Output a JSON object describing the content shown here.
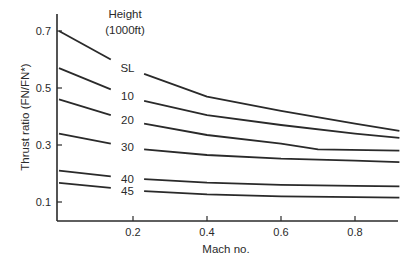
{
  "chart_data": {
    "type": "line",
    "title": "",
    "xlabel": "Mach no.",
    "ylabel": "Thrust ratio (FN/FN*)",
    "xlim": [
      0,
      0.92
    ],
    "ylim": [
      0.03,
      0.75
    ],
    "xticks": [
      0.2,
      0.4,
      0.6,
      0.8
    ],
    "xtick_labels": [
      "0.2",
      "0.4",
      "0.6",
      "0.8"
    ],
    "yticks": [
      0.1,
      0.3,
      0.5,
      0.7
    ],
    "ytick_labels": [
      "0.1",
      "0.3",
      "0.5",
      "0.7"
    ],
    "grid": false,
    "legend_title": [
      "Height",
      "(1000ft)"
    ],
    "legend_position": "inline labels between M=0.14 and M=0.23",
    "label_gap": [
      0.14,
      0.23
    ],
    "series": [
      {
        "name": "SL",
        "x": [
          0,
          0.14,
          0.23,
          0.4,
          0.6,
          0.8,
          0.92
        ],
        "values": [
          0.7,
          0.6,
          0.55,
          0.47,
          0.42,
          0.375,
          0.35
        ]
      },
      {
        "name": "10",
        "x": [
          0,
          0.14,
          0.23,
          0.4,
          0.6,
          0.8,
          0.92
        ],
        "values": [
          0.57,
          0.495,
          0.455,
          0.405,
          0.37,
          0.34,
          0.325
        ]
      },
      {
        "name": "20",
        "x": [
          0,
          0.14,
          0.23,
          0.4,
          0.6,
          0.7,
          0.92
        ],
        "values": [
          0.46,
          0.405,
          0.375,
          0.335,
          0.305,
          0.285,
          0.28
        ]
      },
      {
        "name": "30",
        "x": [
          0,
          0.14,
          0.23,
          0.4,
          0.6,
          0.8,
          0.92
        ],
        "values": [
          0.34,
          0.305,
          0.285,
          0.265,
          0.252,
          0.245,
          0.24
        ]
      },
      {
        "name": "40",
        "x": [
          0,
          0.14,
          0.23,
          0.4,
          0.6,
          0.8,
          0.92
        ],
        "values": [
          0.21,
          0.19,
          0.18,
          0.168,
          0.16,
          0.157,
          0.155
        ]
      },
      {
        "name": "45",
        "x": [
          0,
          0.14,
          0.23,
          0.4,
          0.6,
          0.8,
          0.92
        ],
        "values": [
          0.167,
          0.15,
          0.138,
          0.127,
          0.12,
          0.117,
          0.115
        ]
      }
    ],
    "line_color": "#2a2a2a"
  }
}
